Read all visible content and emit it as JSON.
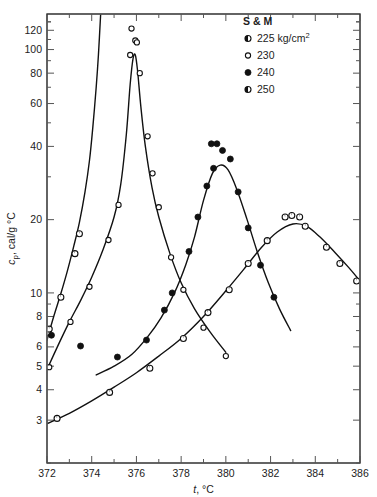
{
  "chart_data": {
    "type": "scatter",
    "title": "",
    "xlabel": "t, °C",
    "ylabel": "cₚ, cal/g °C",
    "xlim": [
      372,
      386
    ],
    "ylim": [
      2,
      140
    ],
    "yscale": "log",
    "xscale": "linear",
    "grid": false,
    "xticks": [
      372,
      374,
      376,
      378,
      380,
      382,
      384,
      386
    ],
    "xtick_labels": [
      "372",
      "374",
      "376",
      "378",
      "380",
      "382",
      "384",
      "386"
    ],
    "xminor_ticks": [
      373,
      375,
      377,
      379,
      381,
      383,
      385
    ],
    "yticks": [
      3,
      4,
      5,
      6,
      8,
      10,
      20,
      40,
      60,
      80,
      100,
      120
    ],
    "ytick_labels": [
      "3",
      "4",
      "5",
      "6",
      "8",
      "10",
      "20",
      "40",
      "60",
      "80",
      "100",
      "120"
    ],
    "yminor_ticks": [
      2,
      7,
      9,
      30,
      50,
      70,
      90,
      110,
      130
    ],
    "legend_title": "S & M",
    "legend_position": "top-right",
    "series": [
      {
        "name": "225 kg/cm²",
        "label": "225 kg/cm²",
        "marker": "half-filled-circle",
        "points": [
          {
            "x": 372.05,
            "y": 6.9
          },
          {
            "x": 372.1,
            "y": 7.1
          },
          {
            "x": 372.62,
            "y": 9.6
          },
          {
            "x": 373.25,
            "y": 14.5
          },
          {
            "x": 373.45,
            "y": 17.5
          }
        ],
        "curve": [
          {
            "x": 372.0,
            "y": 6.4
          },
          {
            "x": 372.3,
            "y": 8.0
          },
          {
            "x": 372.6,
            "y": 9.8
          },
          {
            "x": 372.9,
            "y": 12.2
          },
          {
            "x": 373.2,
            "y": 15.6
          },
          {
            "x": 373.45,
            "y": 19.5
          },
          {
            "x": 373.7,
            "y": 26.0
          },
          {
            "x": 373.9,
            "y": 35.0
          },
          {
            "x": 374.05,
            "y": 48.0
          },
          {
            "x": 374.2,
            "y": 70.0
          },
          {
            "x": 374.3,
            "y": 95.0
          },
          {
            "x": 374.4,
            "y": 140.0
          }
        ]
      },
      {
        "name": "230",
        "label": "230",
        "marker": "open-circle",
        "points": [
          {
            "x": 372.1,
            "y": 4.95
          },
          {
            "x": 373.05,
            "y": 7.6
          },
          {
            "x": 373.9,
            "y": 10.6
          },
          {
            "x": 374.75,
            "y": 16.5
          },
          {
            "x": 375.2,
            "y": 23.0
          },
          {
            "x": 375.72,
            "y": 95.0
          },
          {
            "x": 375.78,
            "y": 122.0
          },
          {
            "x": 375.95,
            "y": 109.0
          },
          {
            "x": 376.02,
            "y": 107.0
          },
          {
            "x": 376.15,
            "y": 80.0
          },
          {
            "x": 376.5,
            "y": 44.0
          },
          {
            "x": 376.72,
            "y": 31.0
          },
          {
            "x": 377.0,
            "y": 22.5
          },
          {
            "x": 377.55,
            "y": 14.0
          },
          {
            "x": 378.1,
            "y": 10.3
          },
          {
            "x": 379.0,
            "y": 7.2
          },
          {
            "x": 380.0,
            "y": 5.5
          }
        ],
        "curve": [
          {
            "x": 372.0,
            "y": 4.85
          },
          {
            "x": 372.5,
            "y": 6.1
          },
          {
            "x": 373.0,
            "y": 7.6
          },
          {
            "x": 373.5,
            "y": 9.3
          },
          {
            "x": 374.0,
            "y": 11.6
          },
          {
            "x": 374.5,
            "y": 15.0
          },
          {
            "x": 375.0,
            "y": 20.5
          },
          {
            "x": 375.3,
            "y": 28.0
          },
          {
            "x": 375.55,
            "y": 45.0
          },
          {
            "x": 375.72,
            "y": 72.0
          },
          {
            "x": 375.85,
            "y": 92.0
          },
          {
            "x": 375.95,
            "y": 95.0
          },
          {
            "x": 376.05,
            "y": 82.0
          },
          {
            "x": 376.2,
            "y": 58.0
          },
          {
            "x": 376.4,
            "y": 40.0
          },
          {
            "x": 376.7,
            "y": 27.0
          },
          {
            "x": 377.0,
            "y": 20.5
          },
          {
            "x": 377.5,
            "y": 14.5
          },
          {
            "x": 378.0,
            "y": 11.0
          },
          {
            "x": 378.6,
            "y": 8.6
          },
          {
            "x": 379.3,
            "y": 6.9
          },
          {
            "x": 380.0,
            "y": 5.7
          }
        ]
      },
      {
        "name": "240",
        "label": "240",
        "marker": "filled-circle",
        "points": [
          {
            "x": 372.2,
            "y": 6.7
          },
          {
            "x": 373.5,
            "y": 6.05
          },
          {
            "x": 375.15,
            "y": 5.45
          },
          {
            "x": 376.45,
            "y": 6.4
          },
          {
            "x": 377.25,
            "y": 8.5
          },
          {
            "x": 377.6,
            "y": 10.0
          },
          {
            "x": 378.35,
            "y": 14.8
          },
          {
            "x": 378.75,
            "y": 20.5
          },
          {
            "x": 379.15,
            "y": 27.5
          },
          {
            "x": 379.45,
            "y": 32.5
          },
          {
            "x": 379.35,
            "y": 41.0
          },
          {
            "x": 379.6,
            "y": 41.0
          },
          {
            "x": 379.85,
            "y": 38.5
          },
          {
            "x": 380.2,
            "y": 35.5
          },
          {
            "x": 380.55,
            "y": 26.0
          },
          {
            "x": 381.0,
            "y": 18.5
          },
          {
            "x": 381.55,
            "y": 13.0
          },
          {
            "x": 382.15,
            "y": 9.6
          }
        ],
        "curve": [
          {
            "x": 374.2,
            "y": 4.6
          },
          {
            "x": 375.0,
            "y": 5.0
          },
          {
            "x": 375.8,
            "y": 5.6
          },
          {
            "x": 376.5,
            "y": 6.6
          },
          {
            "x": 377.1,
            "y": 7.9
          },
          {
            "x": 377.7,
            "y": 10.0
          },
          {
            "x": 378.2,
            "y": 13.0
          },
          {
            "x": 378.6,
            "y": 17.0
          },
          {
            "x": 379.0,
            "y": 24.0
          },
          {
            "x": 379.4,
            "y": 31.0
          },
          {
            "x": 379.75,
            "y": 33.5
          },
          {
            "x": 380.1,
            "y": 32.0
          },
          {
            "x": 380.5,
            "y": 26.5
          },
          {
            "x": 380.95,
            "y": 20.0
          },
          {
            "x": 381.4,
            "y": 14.8
          },
          {
            "x": 381.9,
            "y": 11.0
          },
          {
            "x": 382.4,
            "y": 8.6
          },
          {
            "x": 382.9,
            "y": 7.0
          }
        ]
      },
      {
        "name": "250",
        "label": "250",
        "marker": "half-filled-circle",
        "points": [
          {
            "x": 372.45,
            "y": 3.05
          },
          {
            "x": 374.8,
            "y": 3.9
          },
          {
            "x": 376.6,
            "y": 4.9
          },
          {
            "x": 378.1,
            "y": 6.5
          },
          {
            "x": 379.2,
            "y": 8.3
          },
          {
            "x": 380.15,
            "y": 10.3
          },
          {
            "x": 381.0,
            "y": 13.2
          },
          {
            "x": 381.85,
            "y": 16.4
          },
          {
            "x": 382.65,
            "y": 20.5
          },
          {
            "x": 382.95,
            "y": 20.8
          },
          {
            "x": 383.3,
            "y": 20.5
          },
          {
            "x": 383.55,
            "y": 18.8
          },
          {
            "x": 384.5,
            "y": 15.4
          },
          {
            "x": 385.1,
            "y": 13.2
          },
          {
            "x": 385.85,
            "y": 11.2
          }
        ],
        "curve": [
          {
            "x": 372.0,
            "y": 2.9
          },
          {
            "x": 373.0,
            "y": 3.2
          },
          {
            "x": 374.0,
            "y": 3.6
          },
          {
            "x": 375.0,
            "y": 4.1
          },
          {
            "x": 376.0,
            "y": 4.7
          },
          {
            "x": 377.0,
            "y": 5.5
          },
          {
            "x": 378.0,
            "y": 6.5
          },
          {
            "x": 379.0,
            "y": 8.0
          },
          {
            "x": 380.0,
            "y": 10.2
          },
          {
            "x": 380.8,
            "y": 12.5
          },
          {
            "x": 381.6,
            "y": 15.4
          },
          {
            "x": 382.3,
            "y": 17.8
          },
          {
            "x": 383.0,
            "y": 19.2
          },
          {
            "x": 383.6,
            "y": 18.8
          },
          {
            "x": 384.2,
            "y": 17.0
          },
          {
            "x": 384.9,
            "y": 14.6
          },
          {
            "x": 385.5,
            "y": 12.7
          },
          {
            "x": 386.0,
            "y": 11.2
          }
        ]
      }
    ]
  }
}
